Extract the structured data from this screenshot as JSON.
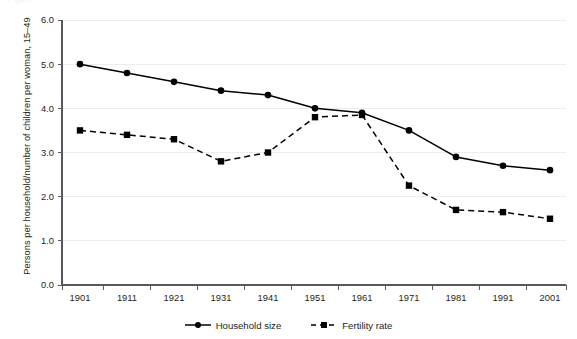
{
  "figure": {
    "cropped_caption": "Figure",
    "background_color": "#ffffff",
    "ink_color": "#231f20",
    "gridline_color": "#ededed",
    "series_color": "#000000"
  },
  "chart_data": {
    "type": "line",
    "title": "",
    "xlabel": "",
    "ylabel": "Persons per household/number of children per woman, 15–49",
    "categories": [
      "1901",
      "1911",
      "1921",
      "1931",
      "1941",
      "1951",
      "1961",
      "1971",
      "1981",
      "1991",
      "2001"
    ],
    "ylim": [
      0.0,
      6.0
    ],
    "ytick_labels": [
      "0.0",
      "1.0",
      "2.0",
      "3.0",
      "4.0",
      "5.0",
      "6.0"
    ],
    "ytick_values": [
      0.0,
      1.0,
      2.0,
      3.0,
      4.0,
      5.0,
      6.0
    ],
    "grid": "horizontal",
    "legend_position": "bottom-center",
    "series": [
      {
        "name": "Household size",
        "marker": "circle",
        "linestyle": "solid",
        "color": "#000000",
        "values": [
          5.0,
          4.8,
          4.6,
          4.4,
          4.3,
          4.0,
          3.9,
          3.5,
          2.9,
          2.7,
          2.6
        ]
      },
      {
        "name": "Fertility rate",
        "marker": "square",
        "linestyle": "dashed",
        "color": "#000000",
        "values": [
          3.5,
          3.4,
          3.3,
          2.8,
          3.0,
          3.8,
          3.85,
          2.25,
          1.7,
          1.65,
          1.5
        ]
      }
    ]
  },
  "legend": {
    "entries": [
      {
        "label": "Household size",
        "marker": "circle-marker",
        "line": "solid"
      },
      {
        "label": "Fertility rate",
        "marker": "square-marker",
        "line": "dashed"
      }
    ]
  }
}
